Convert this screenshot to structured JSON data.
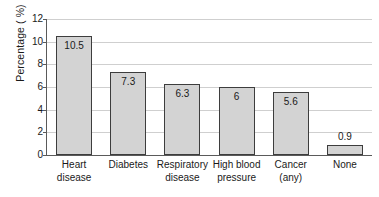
{
  "chart_data": {
    "type": "bar",
    "title": "",
    "xlabel": "",
    "ylabel": "Percentage ( %)",
    "ylim": [
      0,
      12
    ],
    "yticks": [
      "0",
      "2",
      "4",
      "6",
      "8",
      "10",
      "12"
    ],
    "grid": true,
    "legend": "none",
    "categories": [
      "Heart disease",
      "Diabetes",
      "Respiratory disease",
      "High blood pressure",
      "Cancer (any)",
      "None"
    ],
    "category_lines": [
      [
        "Heart disease"
      ],
      [
        "Diabetes"
      ],
      [
        "Respiratory",
        "disease"
      ],
      [
        "High blood",
        "pressure"
      ],
      [
        "Cancer (any)"
      ],
      [
        "None"
      ]
    ],
    "values": [
      10.5,
      7.3,
      6.3,
      6,
      5.6,
      0.9
    ],
    "value_labels": [
      "10.5",
      "7.3",
      "6.3",
      "6",
      "5.6",
      "0.9"
    ],
    "label_placement": [
      "inside",
      "inside",
      "inside",
      "inside",
      "inside",
      "outside"
    ],
    "colors": {
      "bar_fill": "#d3d3d3",
      "bar_border": "#3d3d3d",
      "gridline": "#cfcfcf",
      "axis": "#5a5a5a",
      "text": "#1a1a1a",
      "background": "#ffffff"
    }
  }
}
